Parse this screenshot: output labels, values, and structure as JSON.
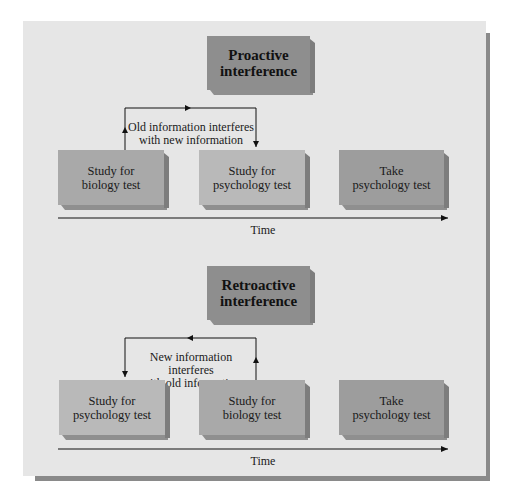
{
  "proactive": {
    "title_line1": "Proactive",
    "title_line2": "interference",
    "connector_label_line1": "Old information interferes",
    "connector_label_line2": "with new information",
    "boxes": [
      {
        "line1": "Study for",
        "line2": "biology test"
      },
      {
        "line1": "Study for",
        "line2": "psychology test"
      },
      {
        "line1": "Take",
        "line2": "psychology test"
      }
    ],
    "axis_label": "Time"
  },
  "retroactive": {
    "title_line1": "Retroactive",
    "title_line2": "interference",
    "connector_label_line1": "New information interferes",
    "connector_label_line2": "with old information",
    "boxes": [
      {
        "line1": "Study for",
        "line2": "psychology test"
      },
      {
        "line1": "Study for",
        "line2": "biology test"
      },
      {
        "line1": "Take",
        "line2": "psychology test"
      }
    ],
    "axis_label": "Time"
  },
  "colors": {
    "panel": "#e6e6e6",
    "title_box": "#8e8e8e",
    "step_box_light": "#b9b9b9",
    "step_box_mid": "#a9a9a9",
    "step_box_dark": "#9d9d9d",
    "shadow": "#8a8a8a"
  }
}
